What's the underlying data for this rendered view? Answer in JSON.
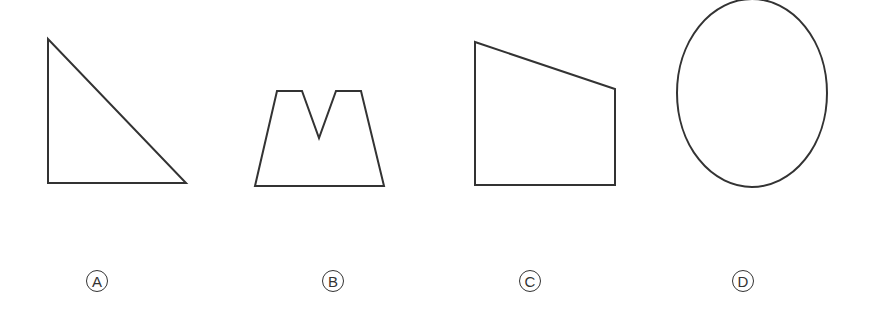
{
  "figure": {
    "stroke_color": "#333333",
    "background": "#ffffff",
    "options": [
      {
        "label": "A",
        "shape": "right-triangle",
        "points": "48,39 48,183 186,183",
        "label_pos": {
          "x": 97,
          "y": 281
        }
      },
      {
        "label": "B",
        "shape": "trapezoid-with-v-notch",
        "points": "255,186 277,91 302,91 319,138 336,91 361,91 384,186",
        "label_pos": {
          "x": 333,
          "y": 281
        }
      },
      {
        "label": "C",
        "shape": "right-trapezoid",
        "points": "475,42 615,89 615,185 475,185",
        "label_pos": {
          "x": 530,
          "y": 281
        }
      },
      {
        "label": "D",
        "shape": "ellipse",
        "ellipse": {
          "cx": 752,
          "cy": 93,
          "rx": 75,
          "ry": 94
        },
        "label_pos": {
          "x": 743,
          "y": 281
        }
      }
    ]
  }
}
